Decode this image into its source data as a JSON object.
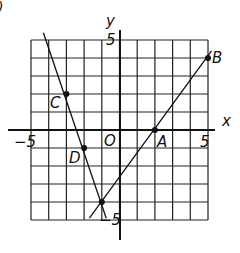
{
  "figure": {
    "corner_mark": ")",
    "axes": {
      "x_label": "x",
      "y_label": "y",
      "x_tick_neg": "−5",
      "x_tick_pos": "5",
      "y_tick_pos": "5",
      "y_tick_neg": "−5",
      "origin_label": "O"
    },
    "points": [
      {
        "name": "A",
        "x": 2,
        "y": 0
      },
      {
        "name": "B",
        "x": 5,
        "y": 4
      },
      {
        "name": "C",
        "x": -3,
        "y": 2
      },
      {
        "name": "D",
        "x": -2,
        "y": -1
      },
      {
        "name": "",
        "x": -1,
        "y": -4
      }
    ],
    "lines": [
      {
        "through": [
          "C",
          "D"
        ],
        "from": [
          -4.3,
          5.4
        ],
        "to": [
          -0.75,
          -4.9
        ]
      },
      {
        "through": [
          "A",
          "B"
        ],
        "from": [
          -1.7,
          -4.9
        ],
        "to": [
          5.2,
          4.4
        ]
      }
    ],
    "grid": {
      "xmin": -5,
      "xmax": 5,
      "ymin": -5,
      "ymax": 5,
      "step": 1
    }
  }
}
